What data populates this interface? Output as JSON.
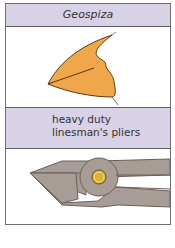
{
  "panels": [
    {
      "label": "Geospiza",
      "illustration": "finch-beak-icon",
      "fill": "#f0a64a"
    },
    {
      "label_lines": [
        "heavy duty",
        "linesman's pliers"
      ],
      "illustration": "pliers-icon",
      "fill": "#a89c97",
      "pivot": "#d9b43a"
    }
  ],
  "colors": {
    "header_bg": "#d9d1e6",
    "border": "#6f6f75"
  }
}
